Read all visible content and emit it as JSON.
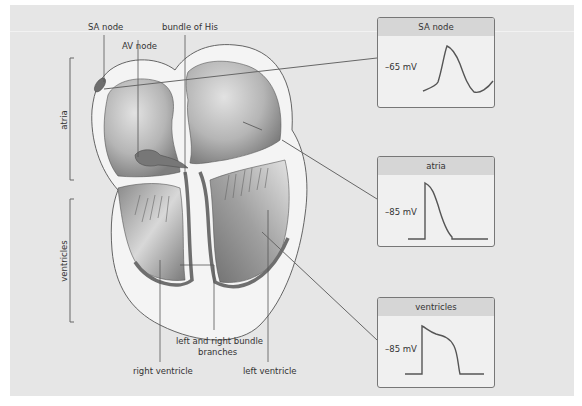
{
  "diagram": {
    "labels": {
      "sa_node": "SA node",
      "av_node": "AV node",
      "bundle_of_his": "bundle of His",
      "bundle_branches_line1": "left and right bundle",
      "bundle_branches_line2": "branches",
      "right_ventricle": "right ventricle",
      "left_ventricle": "left ventricle"
    },
    "brackets": {
      "atria": "atria",
      "ventricles": "ventricles"
    },
    "action_potentials": [
      {
        "title": "SA node",
        "resting": "–65 mV",
        "shape": "pacemaker"
      },
      {
        "title": "atria",
        "resting": "–85 mV",
        "shape": "fast"
      },
      {
        "title": "ventricles",
        "resting": "–85 mV",
        "shape": "plateau"
      }
    ],
    "colors": {
      "panel_bg": "#e6e6e6",
      "box_header": "#d6d6d6",
      "line": "#666666",
      "node_fill": "#6e6e6e"
    }
  }
}
